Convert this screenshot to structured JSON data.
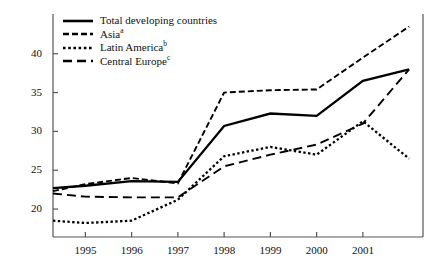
{
  "chart_data": {
    "type": "line",
    "title": "",
    "subtitle": "",
    "xlabel": "",
    "ylabel": "",
    "x": [
      1994.3,
      1995,
      1996,
      1997,
      1998,
      1999,
      2000,
      2001,
      2002
    ],
    "xtick_labels": [
      "1995",
      "1996",
      "1997",
      "1998",
      "1999",
      "2000",
      "2001"
    ],
    "xtick_values": [
      1995,
      1996,
      1997,
      1998,
      1999,
      2000,
      2001
    ],
    "xlim": [
      1994.3,
      2002.3
    ],
    "ytick_labels": [
      "20",
      "25",
      "30",
      "35",
      "40"
    ],
    "ytick_values": [
      20,
      25,
      30,
      35,
      40
    ],
    "ylim": [
      16.4,
      44.6
    ],
    "grid": false,
    "legend_position": "top-left",
    "series": [
      {
        "name": "Total developing countries",
        "label": "Total developing countries",
        "superscript": "",
        "style": "solid",
        "dash": "none",
        "width": 2.3,
        "color": "#000000",
        "values": [
          22.7,
          23.0,
          23.6,
          23.5,
          30.7,
          32.3,
          32.0,
          36.5,
          38.0
        ]
      },
      {
        "name": "Asia",
        "label": "Asia",
        "superscript": "a",
        "style": "short-dash",
        "dash": "6,3",
        "width": 1.9,
        "color": "#000000",
        "values": [
          22.3,
          23.2,
          24.0,
          23.3,
          35.0,
          35.3,
          35.4,
          39.5,
          43.5
        ]
      },
      {
        "name": "Latin America",
        "label": "Latin America",
        "superscript": "b",
        "style": "dotted",
        "dash": "2.4,2.4",
        "width": 2.3,
        "color": "#000000",
        "values": [
          18.5,
          18.2,
          18.5,
          21.2,
          26.8,
          28.0,
          27.0,
          31.3,
          26.5
        ]
      },
      {
        "name": "Central Europe",
        "label": "Central Europe",
        "superscript": "c",
        "style": "long-dash",
        "dash": "9,5",
        "width": 1.9,
        "color": "#000000",
        "values": [
          22.0,
          21.6,
          21.5,
          21.5,
          25.5,
          27.0,
          28.3,
          31.0,
          38.0
        ]
      }
    ]
  },
  "axes": {
    "line_color": "#555555"
  }
}
